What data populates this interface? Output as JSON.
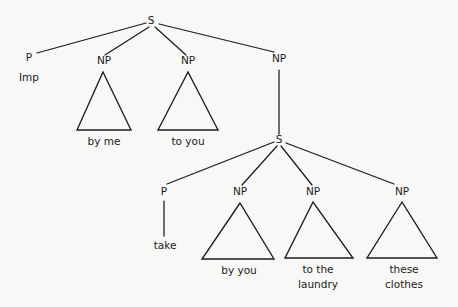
{
  "diagram": {
    "type": "syntax-tree",
    "background_color": "#f8f8f6",
    "line_color": "#1b1b1b",
    "text_color": "#1b1b1b",
    "matrix_clause": {
      "root": "S",
      "constituents": [
        {
          "node": "P",
          "leaf": "Imp",
          "leaf_style": "plain"
        },
        {
          "node": "NP",
          "leaf": "by me",
          "leaf_style": "triangle"
        },
        {
          "node": "NP",
          "leaf": "to you",
          "leaf_style": "triangle"
        },
        {
          "node": "NP",
          "leaf": "",
          "leaf_style": "embedded-s"
        }
      ]
    },
    "embedded_clause": {
      "root": "S",
      "constituents": [
        {
          "node": "P",
          "leaf": "take",
          "leaf_style": "line"
        },
        {
          "node": "NP",
          "leaf": "by you",
          "leaf_style": "triangle"
        },
        {
          "node": "NP",
          "leaf": "to the laundry",
          "leaf_line_1": "to the",
          "leaf_line_2": "laundry",
          "leaf_style": "triangle"
        },
        {
          "node": "NP",
          "leaf": "these clothes",
          "leaf_line_1": "these",
          "leaf_line_2": "clothes",
          "leaf_style": "triangle"
        }
      ]
    },
    "labels": {
      "s_top": "S",
      "p_top": "P",
      "imp": "Imp",
      "np_1": "NP",
      "np_2": "NP",
      "np_3": "NP",
      "by_me": "by me",
      "to_you": "to you",
      "s_embedded": "S",
      "p_embedded": "P",
      "take": "take",
      "np_4": "NP",
      "np_5": "NP",
      "np_6": "NP",
      "by_you": "by you",
      "to_the": "to the",
      "laundry": "laundry",
      "these": "these",
      "clothes": "clothes"
    }
  }
}
